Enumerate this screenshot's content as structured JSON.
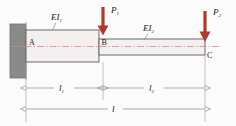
{
  "figure": {
    "colors": {
      "beam_outline": "#5a5a5a",
      "beam_fill": "#f5f0f0",
      "centerline": "#d08c8c",
      "load_arrow": "#b03a2e",
      "support_block": "#8a8a8a",
      "support_edge": "#6e6e6e",
      "dimension_line": "#8a8a8a",
      "text": "#1a1a1a",
      "background": "#fbfbfb"
    },
    "nodes": [
      {
        "id": "A",
        "label": "A",
        "x": 26,
        "y": 41
      },
      {
        "id": "B",
        "label": "B",
        "x": 99,
        "y": 41
      },
      {
        "id": "C",
        "label": "C",
        "x": 205,
        "y": 55
      }
    ],
    "segments": [
      {
        "id": "seg1",
        "stiffness_label": "EI",
        "stiffness_sub": "1",
        "from": "A",
        "to": "B"
      },
      {
        "id": "seg2",
        "stiffness_label": "EI",
        "stiffness_sub": "2",
        "from": "B",
        "to": "C"
      }
    ],
    "loads": [
      {
        "id": "P1",
        "label": "P",
        "sub": "1",
        "at_node": "B",
        "x": 103,
        "direction": "down"
      },
      {
        "id": "P2",
        "label": "P",
        "sub": "2",
        "at_node": "C",
        "x": 205,
        "direction": "down"
      }
    ],
    "dimensions": [
      {
        "id": "l1",
        "label": "l",
        "sub": "1",
        "from_x": 26,
        "to_x": 103,
        "y": 88
      },
      {
        "id": "l2",
        "label": "l",
        "sub": "2",
        "from_x": 103,
        "to_x": 205,
        "y": 88
      },
      {
        "id": "l",
        "label": "l",
        "sub": "",
        "from_x": 26,
        "to_x": 205,
        "y": 109
      }
    ],
    "support": {
      "type": "fixed-wall",
      "at_node": "A"
    }
  }
}
